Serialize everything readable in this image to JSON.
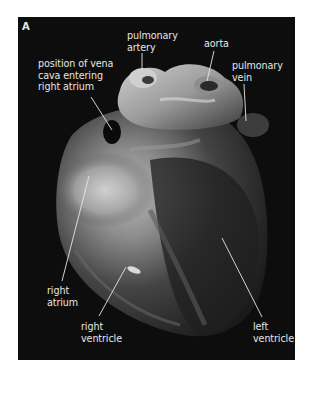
{
  "figure": {
    "panel_letter": "A",
    "background_color": "#0d0d0d",
    "label_color": "#e6e6e6",
    "labels": [
      {
        "id": "pulmonary-artery",
        "text": "pulmonary\nartery"
      },
      {
        "id": "aorta",
        "text": "aorta"
      },
      {
        "id": "pulmonary-vein",
        "text": "pulmonary\nvein"
      },
      {
        "id": "vena-cava",
        "text": "position of vena\ncava entering\nright atrium"
      },
      {
        "id": "right-atrium",
        "text": "right\natrium"
      },
      {
        "id": "right-ventricle",
        "text": "right\nventricle"
      },
      {
        "id": "left-ventricle",
        "text": "left\nventricle"
      }
    ]
  }
}
